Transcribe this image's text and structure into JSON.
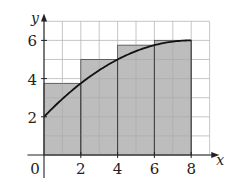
{
  "chart_data": {
    "type": "bar",
    "subtype": "riemann-sum-right-endpoint-with-curve",
    "title": "",
    "xlabel": "x",
    "ylabel": "y",
    "xlim": [
      0,
      9
    ],
    "ylim": [
      0,
      7
    ],
    "grid": true,
    "grid_step": 1,
    "x_ticks": [
      0,
      2,
      4,
      6,
      8
    ],
    "x_tick_labels": [
      "0",
      "2",
      "4",
      "6",
      "8"
    ],
    "y_ticks": [
      2,
      4,
      6
    ],
    "y_tick_labels": [
      "2",
      "4",
      "6"
    ],
    "rectangles": [
      {
        "x0": 0,
        "x1": 2,
        "height": 3.75
      },
      {
        "x0": 2,
        "x1": 4,
        "height": 5
      },
      {
        "x0": 4,
        "x1": 6,
        "height": 5.75
      },
      {
        "x0": 6,
        "x1": 8,
        "height": 6
      }
    ],
    "curve": {
      "description": "increasing concave-down curve from (0,2) to (8,6)",
      "points": [
        [
          0,
          2
        ],
        [
          1,
          2.94
        ],
        [
          2,
          3.75
        ],
        [
          3,
          4.44
        ],
        [
          4,
          5
        ],
        [
          5,
          5.44
        ],
        [
          6,
          5.75
        ],
        [
          7,
          5.94
        ],
        [
          8,
          6
        ]
      ]
    },
    "colors": {
      "fill": "#bdbdbd",
      "grid": "#b8b8b8",
      "axis": "#222222",
      "curve": "#111111"
    }
  }
}
